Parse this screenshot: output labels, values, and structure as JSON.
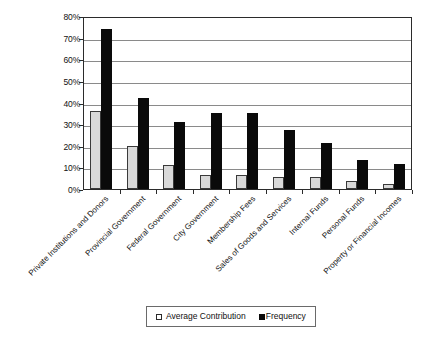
{
  "chart_data": {
    "type": "bar",
    "title": "",
    "subtitle": "",
    "xlabel": "",
    "ylabel": "",
    "ylim": [
      0,
      80
    ],
    "ytick_labels": [
      "80%",
      "70%",
      "60%",
      "50%",
      "40%",
      "30%",
      "20%",
      "10%",
      "0%"
    ],
    "ytick_values": [
      80,
      70,
      60,
      50,
      40,
      30,
      20,
      10,
      0
    ],
    "grid": true,
    "legend_position": "bottom",
    "categories": [
      "Private Institutions and Donors",
      "Provincial Government",
      "Federal Government",
      "City Government",
      "Membership Fees",
      "Sales of Goods and Services",
      "Internal Funds",
      "Personal Funds",
      "Property or Financial Incomes"
    ],
    "series": [
      {
        "name": "Average Contribution",
        "color": "#d9d9d9",
        "values": [
          36,
          20,
          11,
          6.5,
          6.5,
          5.5,
          5.5,
          3.5,
          2.5
        ]
      },
      {
        "name": "Frequency",
        "color": "#0a0a0a",
        "values": [
          74,
          42,
          31,
          35,
          35,
          27.5,
          21.5,
          13.5,
          11.5
        ]
      }
    ]
  },
  "legend": {
    "items": [
      {
        "label": "Average Contribution",
        "swatch": "light"
      },
      {
        "label": "Frequency",
        "swatch": "dark"
      }
    ]
  }
}
